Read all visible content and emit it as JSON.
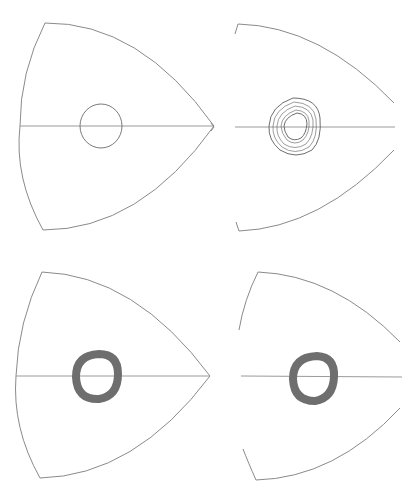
{
  "figure": {
    "colors": {
      "background": "#ffffff",
      "outline": "#8a8a8a",
      "orbit_band": "#6e6e6e"
    },
    "panels": [
      {
        "id": "top-left",
        "shape": "closed rounded triangle",
        "inner": "single circle"
      },
      {
        "id": "top-right",
        "shape": "open rounded triangle (gaps at tip and left side)",
        "inner": "rounded-triangular band of overlapping loops"
      },
      {
        "id": "bottom-left",
        "shape": "closed rounded triangle",
        "inner": "dense dark ring"
      },
      {
        "id": "bottom-right",
        "shape": "open rounded triangle (gaps at tip and left side)",
        "inner": "dense dark ring"
      }
    ]
  }
}
